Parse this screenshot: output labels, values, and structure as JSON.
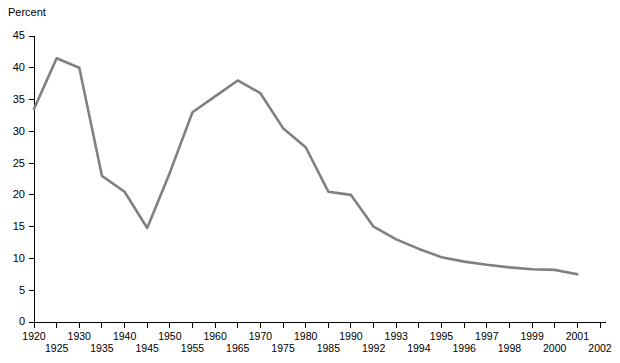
{
  "chart_data": {
    "type": "line",
    "title": "",
    "subtitle": "",
    "ylabel": "Percent",
    "xlabel": "",
    "ylim": [
      0,
      45
    ],
    "yticks": [
      0,
      5,
      10,
      15,
      20,
      25,
      30,
      35,
      40,
      45
    ],
    "grid": false,
    "legend": false,
    "legend_position": "none",
    "line_color": "#808080",
    "axis_color": "#000000",
    "background_color": "#ffffff",
    "x_axis_note": "Tick slots are evenly spaced categories; spacing changes from 5-year intervals through 1990 to 1-year intervals afterward. Labels are staggered on two rows (alternating upper/lower).",
    "categories": [
      "1920",
      "1925",
      "1930",
      "1935",
      "1940",
      "1945",
      "1950",
      "1955",
      "1960",
      "1965",
      "1970",
      "1975",
      "1980",
      "1985",
      "1990",
      "1992",
      "1993",
      "1994",
      "1995",
      "1996",
      "1997",
      "1998",
      "1999",
      "2000",
      "2001",
      "2002"
    ],
    "label_rows": [
      "upper",
      "lower",
      "upper",
      "lower",
      "upper",
      "lower",
      "upper",
      "lower",
      "upper",
      "lower",
      "upper",
      "lower",
      "upper",
      "lower",
      "upper",
      "lower",
      "upper",
      "lower",
      "upper",
      "lower",
      "upper",
      "lower",
      "upper",
      "lower",
      "upper",
      "lower"
    ],
    "series": [
      {
        "name": "Percent",
        "color": "#808080",
        "values": [
          33.5,
          41.5,
          40.0,
          23.0,
          20.5,
          14.8,
          23.5,
          33.0,
          35.5,
          38.0,
          36.0,
          30.5,
          27.5,
          20.5,
          20.0,
          15.0,
          13.0,
          11.5,
          10.2,
          9.5,
          9.0,
          8.6,
          8.3,
          8.2,
          7.5,
          null
        ]
      }
    ]
  }
}
